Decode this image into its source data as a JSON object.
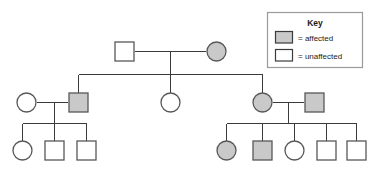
{
  "diagram": {
    "type": "pedigree-chart",
    "generations": 3,
    "colors": {
      "affected_fill": "#c9c9c9",
      "unaffected_fill": "#ffffff",
      "stroke": "#58585a",
      "line": "#3b3b3d",
      "legend_border": "#9a9a9c",
      "text": "#1a1a1a",
      "background": "#ffffff"
    }
  },
  "legend": {
    "title": "Key",
    "entries": [
      {
        "swatch": "affected-swatch",
        "fill": "#c9c9c9",
        "label": "= affected"
      },
      {
        "swatch": "unaffected-swatch",
        "fill": "#ffffff",
        "label": "= unaffected"
      }
    ]
  },
  "individuals": {
    "gen1": [
      {
        "id": "I-1",
        "shape": "square",
        "sex": "male",
        "status": "unaffected",
        "cx": 124.5,
        "cy": 51.5
      },
      {
        "id": "I-2",
        "shape": "circle",
        "sex": "female",
        "status": "affected",
        "cx": 216.5,
        "cy": 51.5
      }
    ],
    "gen2": [
      {
        "id": "II-1",
        "shape": "circle",
        "sex": "female",
        "status": "unaffected",
        "cx": 26.5,
        "cy": 102.5
      },
      {
        "id": "II-2",
        "shape": "square",
        "sex": "male",
        "status": "affected",
        "cx": 78.5,
        "cy": 102.5
      },
      {
        "id": "II-3",
        "shape": "circle",
        "sex": "female",
        "status": "unaffected",
        "cx": 170.5,
        "cy": 102.5
      },
      {
        "id": "II-4",
        "shape": "circle",
        "sex": "female",
        "status": "affected",
        "cx": 262.5,
        "cy": 102.5
      },
      {
        "id": "II-5",
        "shape": "square",
        "sex": "male",
        "status": "affected",
        "cx": 314.5,
        "cy": 102.5
      }
    ],
    "gen3": [
      {
        "id": "III-1",
        "shape": "circle",
        "sex": "female",
        "status": "unaffected",
        "cx": 22.5,
        "cy": 150.5
      },
      {
        "id": "III-2",
        "shape": "square",
        "sex": "male",
        "status": "unaffected",
        "cx": 54.5,
        "cy": 150.5
      },
      {
        "id": "III-3",
        "shape": "square",
        "sex": "male",
        "status": "unaffected",
        "cx": 86.5,
        "cy": 150.5
      },
      {
        "id": "III-4",
        "shape": "circle",
        "sex": "female",
        "status": "affected",
        "cx": 226.5,
        "cy": 150.5
      },
      {
        "id": "III-5",
        "shape": "square",
        "sex": "male",
        "status": "affected",
        "cx": 262.5,
        "cy": 150.5
      },
      {
        "id": "III-6",
        "shape": "circle",
        "sex": "female",
        "status": "unaffected",
        "cx": 294.5,
        "cy": 150.5
      },
      {
        "id": "III-7",
        "shape": "square",
        "sex": "male",
        "status": "unaffected",
        "cx": 326.5,
        "cy": 150.5
      },
      {
        "id": "III-8",
        "shape": "square",
        "sex": "male",
        "status": "unaffected",
        "cx": 356.5,
        "cy": 150.5
      }
    ]
  }
}
